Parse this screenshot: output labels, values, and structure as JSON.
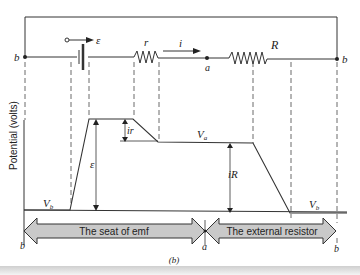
{
  "figure": {
    "caption": "(b)",
    "ylabel": "Potential (volts)",
    "circuit": {
      "node_left": "b",
      "node_mid": "a",
      "node_right": "b",
      "emf_label": "ε",
      "internal_resistor": "r",
      "external_resistor": "R",
      "current_label": "i"
    },
    "plot_labels": {
      "vb_left": "V",
      "vb_left_sub": "b",
      "va": "V",
      "va_sub": "a",
      "vb_right": "V",
      "vb_right_sub": "b",
      "emf_rise": "ε",
      "ir_drop": "ir",
      "iR_drop": "iR"
    },
    "arrows": {
      "left_label": "The seat of emf",
      "right_label": "The external resistor",
      "left_end": "b",
      "mid": "a",
      "right_end": "b"
    },
    "colors": {
      "line": "#333333",
      "arrow_fill": "#c9c9c9"
    }
  }
}
